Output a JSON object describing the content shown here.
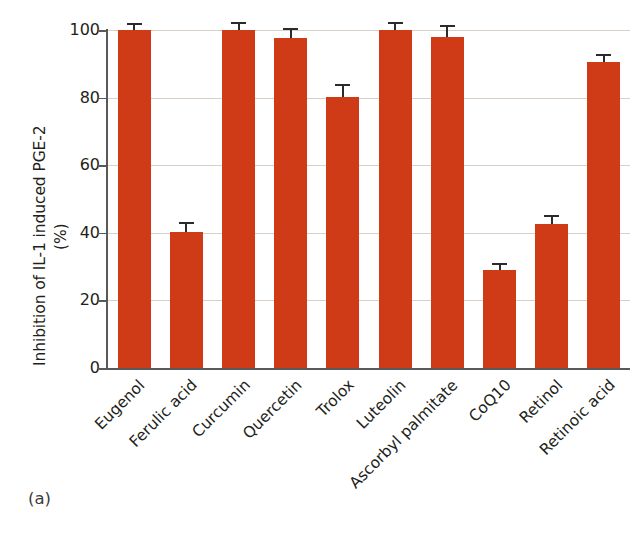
{
  "figure": {
    "panel_caption": "(a)",
    "bar_color": "#cf3a17",
    "grid_color": "#d9cfc6",
    "axis_color": "#58595b",
    "errorbar_color": "#2b2b2b",
    "background": "#ffffff"
  },
  "chart_data": {
    "type": "bar",
    "title": "",
    "xlabel": "",
    "ylabel": "Inhibition of IL-1 induced PGE-2",
    "ylabel_units": "(%)",
    "ylim": [
      0,
      100
    ],
    "yticks": [
      0,
      20,
      40,
      60,
      80,
      100
    ],
    "ytick_labels": [
      "0",
      "20",
      "40",
      "60",
      "80",
      "100"
    ],
    "grid": true,
    "grid_axis": "y",
    "legend": false,
    "orientation": "vertical",
    "categories": [
      "Eugenol",
      "Ferulic acid",
      "Curcumin",
      "Quercetin",
      "Trolox",
      "Luteolin",
      "Ascorbyl palmitate",
      "CoQ10",
      "Retinol",
      "Retinoic acid"
    ],
    "values": [
      100.0,
      40.3,
      100.0,
      97.5,
      80.3,
      100.0,
      98.0,
      29.0,
      42.7,
      90.5
    ],
    "errors": [
      1.5,
      2.2,
      1.8,
      2.6,
      3.0,
      1.8,
      2.8,
      1.5,
      2.0,
      1.8
    ],
    "error_direction": "upper",
    "value_labels": [],
    "annotations": []
  }
}
